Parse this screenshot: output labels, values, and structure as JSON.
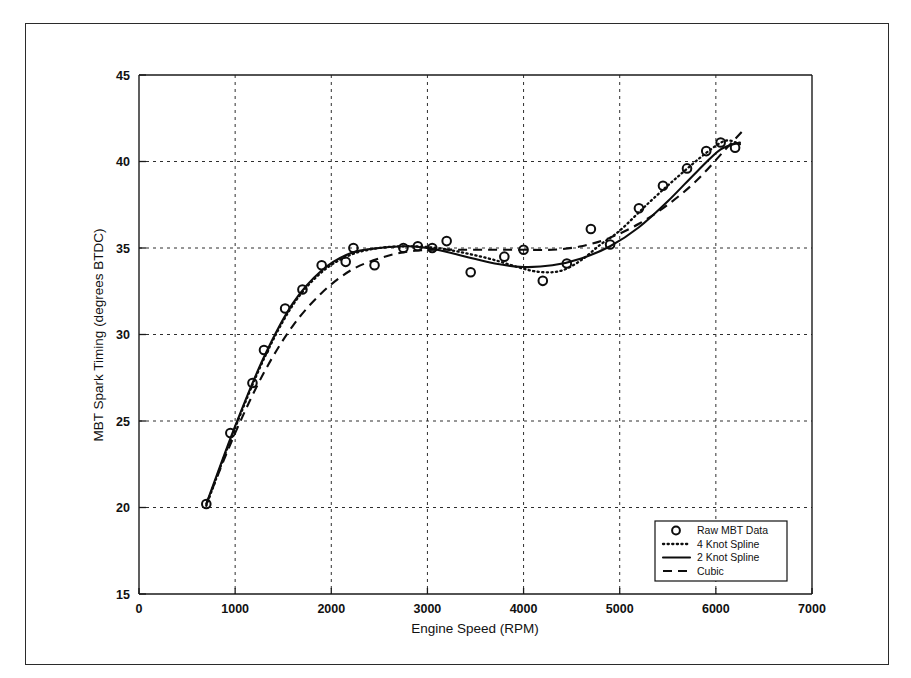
{
  "figure": {
    "frame": {
      "border_color": "#2b2b2b"
    },
    "background": "#ffffff",
    "ink_color": "#0d0d0d"
  },
  "chart_data": {
    "type": "scatter",
    "title": "",
    "xlabel": "Engine Speed (RPM)",
    "ylabel": "MBT Spark Timing (degrees BTDC)",
    "xlim": [
      0,
      7000
    ],
    "ylim": [
      15,
      45
    ],
    "xticks": [
      0,
      1000,
      2000,
      3000,
      4000,
      5000,
      6000,
      7000
    ],
    "yticks": [
      15,
      20,
      25,
      30,
      35,
      40,
      45
    ],
    "xticklabels": [
      "0",
      "1000",
      "2000",
      "3000",
      "4000",
      "5000",
      "6000",
      "7000"
    ],
    "yticklabels": [
      "15",
      "20",
      "25",
      "30",
      "35",
      "40",
      "45"
    ],
    "grid": true,
    "grid_style": "dashed",
    "legend_position": "lower right",
    "series": [
      {
        "name": "Raw MBT Data",
        "style": "markers",
        "marker": "circle",
        "x": [
          700,
          950,
          1180,
          1300,
          1520,
          1700,
          1900,
          2150,
          2230,
          2450,
          2750,
          2900,
          3050,
          3200,
          3450,
          3800,
          4000,
          4200,
          4450,
          4700,
          4900,
          5200,
          5450,
          5700,
          5900,
          6050,
          6200
        ],
        "y": [
          20.2,
          24.3,
          27.2,
          29.1,
          31.5,
          32.6,
          34.0,
          34.2,
          35.0,
          34.0,
          35.0,
          35.1,
          35.0,
          35.4,
          33.6,
          34.5,
          34.9,
          33.1,
          34.1,
          36.1,
          35.2,
          37.3,
          38.6,
          39.6,
          40.6,
          41.1,
          40.8
        ]
      },
      {
        "name": "4 Knot Spline",
        "style": "dotted",
        "x": [
          700,
          1000,
          1300,
          1600,
          1900,
          2200,
          2500,
          2800,
          3100,
          3400,
          3700,
          4000,
          4200,
          4400,
          4600,
          4800,
          5000,
          5300,
          5600,
          5900,
          6100,
          6250
        ],
        "y": [
          20.1,
          24.6,
          28.6,
          31.7,
          33.6,
          34.6,
          35.0,
          35.1,
          35.0,
          34.7,
          34.3,
          33.8,
          33.6,
          33.7,
          34.3,
          35.2,
          36.0,
          37.6,
          39.1,
          40.5,
          41.2,
          41.0
        ]
      },
      {
        "name": "2 Knot Spline",
        "style": "solid",
        "x": [
          700,
          1000,
          1300,
          1600,
          1900,
          2200,
          2500,
          2800,
          3100,
          3400,
          3700,
          4000,
          4300,
          4600,
          4900,
          5200,
          5500,
          5800,
          6050,
          6250
        ],
        "y": [
          20.2,
          24.7,
          28.7,
          31.8,
          33.7,
          34.7,
          35.0,
          35.1,
          34.9,
          34.5,
          34.1,
          33.9,
          34.0,
          34.4,
          35.1,
          36.2,
          37.7,
          39.4,
          40.7,
          41.1
        ]
      },
      {
        "name": "Cubic",
        "style": "dashed",
        "x": [
          700,
          1000,
          1300,
          1600,
          1900,
          2200,
          2500,
          2800,
          3100,
          3400,
          3700,
          4000,
          4300,
          4600,
          4900,
          5200,
          5500,
          5800,
          6100,
          6300
        ],
        "y": [
          20.2,
          24.3,
          27.8,
          30.5,
          32.4,
          33.7,
          34.4,
          34.8,
          34.9,
          34.9,
          34.9,
          34.9,
          34.9,
          35.1,
          35.6,
          36.4,
          37.5,
          38.9,
          40.7,
          41.9
        ]
      }
    ]
  },
  "legend": {
    "entries": [
      {
        "label": "Raw MBT Data",
        "style": "marker"
      },
      {
        "label": "4 Knot Spline",
        "style": "dotted"
      },
      {
        "label": "2 Knot Spline",
        "style": "solid"
      },
      {
        "label": "Cubic",
        "style": "dashed"
      }
    ]
  }
}
